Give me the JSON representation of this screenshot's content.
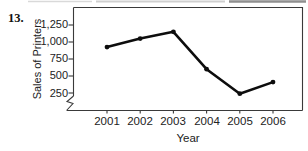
{
  "exercise_number": "13.",
  "chart_data": {
    "type": "line",
    "x": [
      2001,
      2002,
      2003,
      2004,
      2005,
      2006
    ],
    "x_labels": [
      "2001",
      "2002",
      "2003",
      "2004",
      "2005",
      "2006"
    ],
    "values": [
      925,
      1050,
      1150,
      600,
      240,
      410
    ],
    "series_name": "Sales of Printers",
    "title": "",
    "xlabel": "Year",
    "ylabel": "Sales of Printers",
    "yticks": [
      250,
      500,
      750,
      1000,
      1250
    ],
    "ytick_labels": [
      "250",
      "500",
      "750",
      "1,000",
      "1,250"
    ],
    "ylim": [
      250,
      1250
    ],
    "axis_break": true,
    "grid": false,
    "legend": false,
    "marker": "circle",
    "line_color": "#0d0d0d",
    "axis_color": "#3a3a3a"
  }
}
